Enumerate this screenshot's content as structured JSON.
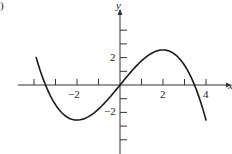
{
  "panel_label": ")",
  "chart_data": {
    "type": "line",
    "title": "",
    "xlabel": "x",
    "ylabel": "y",
    "x_tick_labels": [
      "-2",
      "2",
      "4"
    ],
    "y_tick_labels": [
      "2",
      "-2"
    ],
    "x_ticks": [
      -4,
      -3,
      -2,
      -1,
      1,
      2,
      3,
      4
    ],
    "y_ticks": [
      -4,
      -3,
      -2,
      -1,
      1,
      2,
      3,
      4
    ],
    "xlim": [
      -4.8,
      5
    ],
    "ylim": [
      -5,
      6
    ],
    "grid": false,
    "legend": null,
    "series": [
      {
        "name": "f(x)",
        "x": [
          -3.9,
          -3.5,
          -3,
          -2.5,
          -2,
          -1.5,
          -1,
          -0.5,
          0,
          0.5,
          1,
          1.5,
          2,
          2.5,
          3,
          3.5,
          4
        ],
        "values": [
          2.0,
          -0.14,
          -1.44,
          -2.3,
          -2.56,
          -2.34,
          -1.76,
          -0.94,
          0,
          0.94,
          1.76,
          2.34,
          2.56,
          2.3,
          1.44,
          -0.14,
          -2.56
        ]
      }
    ]
  },
  "axis": {
    "x_name": "x",
    "y_name": "y",
    "labels": {
      "xm2": "−2",
      "x2": "2",
      "x4": "4",
      "y2": "2",
      "ym2": "−2"
    }
  },
  "colors": {
    "axis": "#333333",
    "curve": "#1a1a1a"
  }
}
